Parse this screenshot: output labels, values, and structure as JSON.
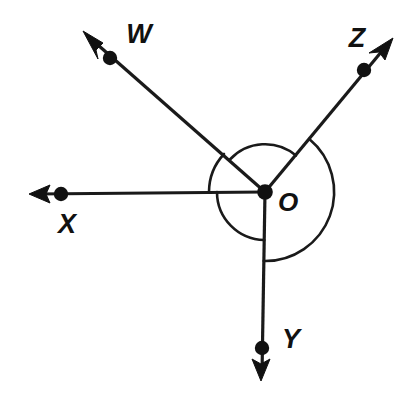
{
  "diagram": {
    "type": "angle-rays-diagram",
    "background_color": "#ffffff",
    "stroke_color": "#1a1a1a",
    "vertex": {
      "name": "O",
      "label": "O",
      "x": 265,
      "y": 192,
      "label_x": 288,
      "label_y": 204
    },
    "rays": [
      {
        "id": "ray-w",
        "label": "W",
        "direction": "upper-left",
        "angle_deg": 137,
        "tip_x": 84,
        "tip_y": 32,
        "dot_x": 110,
        "dot_y": 58,
        "label_x": 139,
        "label_y": 36,
        "arrow": "open-arrow-icon"
      },
      {
        "id": "ray-x",
        "label": "X",
        "direction": "left",
        "angle_deg": 180,
        "tip_x": 30,
        "tip_y": 194,
        "dot_x": 60,
        "dot_y": 194,
        "label_x": 67,
        "label_y": 226,
        "arrow": "open-arrow-icon"
      },
      {
        "id": "ray-y",
        "label": "Y",
        "direction": "down",
        "angle_deg": 271,
        "tip_x": 261,
        "tip_y": 380,
        "dot_x": 262,
        "dot_y": 348,
        "label_x": 291,
        "label_y": 341,
        "arrow": "open-arrow-icon"
      },
      {
        "id": "ray-z",
        "label": "Z",
        "direction": "upper-right",
        "angle_deg": 50,
        "tip_x": 393,
        "tip_y": 39,
        "dot_x": 364,
        "dot_y": 70,
        "label_x": 357,
        "label_y": 40,
        "arrow": "open-arrow-icon"
      }
    ],
    "arcs": [
      {
        "id": "arc-wox",
        "from_ray": "W",
        "to_ray": "X",
        "radius": 56,
        "description": "angle arc between ray W and ray X"
      },
      {
        "id": "arc-xoy",
        "from_ray": "X",
        "to_ray": "Y",
        "radius": 48,
        "description": "angle arc between ray X and ray Y"
      },
      {
        "id": "arc-woz",
        "from_ray": "W",
        "to_ray": "Z",
        "radius": 48,
        "description": "angle arc between ray W and ray Z across the top"
      },
      {
        "id": "arc-zoy",
        "from_ray": "Z",
        "to_ray": "Y",
        "radius": 69,
        "description": "large reflex-side arc from ray Z clockwise to ray Y"
      }
    ]
  }
}
